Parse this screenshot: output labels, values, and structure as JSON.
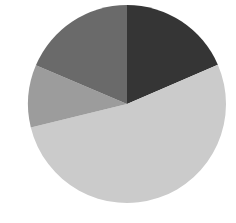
{
  "chart_data": {
    "type": "pie",
    "title": "",
    "start_angle_deg": 0,
    "direction": "clockwise",
    "legend": null,
    "center": [
      127,
      104
    ],
    "radius": 99,
    "slices": [
      {
        "label": "",
        "value": 18.5,
        "color": "#353535"
      },
      {
        "label": "",
        "value": 52.7,
        "color": "#cbcbcb"
      },
      {
        "label": "",
        "value": 10.2,
        "color": "#9c9c9c"
      },
      {
        "label": "",
        "value": 18.6,
        "color": "#6a6a6a"
      }
    ]
  }
}
